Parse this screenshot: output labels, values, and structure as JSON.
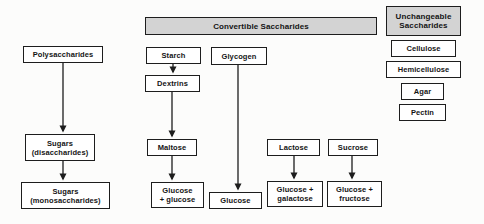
{
  "diagram": {
    "type": "flowchart",
    "topic": "Classification and breakdown of saccharides",
    "colors": {
      "border": "#1d1d1d",
      "header_fill": "#d3d3d3",
      "box_fill": "#ffffff",
      "line": "#1d1d1d",
      "background": "#fcfcfb"
    },
    "headers": {
      "convertible": "Convertible Saccharides",
      "unchangeable": "Unchangeable\nSaccharides"
    },
    "left_column": {
      "polysaccharides": "Polysaccharides",
      "sugars_disaccharides": "Sugars\n(disaccharides)",
      "sugars_monosaccharides": "Sugars\n(monosaccharides)"
    },
    "convertible_column": {
      "starch": "Starch",
      "dextrins": "Dextrins",
      "maltose": "Maltose",
      "glucose_glucose": "Glucose\n+ glucose",
      "glycogen": "Glycogen",
      "glucose": "Glucose",
      "lactose": "Lactose",
      "glucose_galactose": "Glucose +\ngalactose",
      "sucrose": "Sucrose",
      "glucose_fructose": "Glucose +\nfructose"
    },
    "unchangeable_column": {
      "cellulose": "Cellulose",
      "hemicellulose": "Hemicellulose",
      "agar": "Agar",
      "pectin": "Pectin"
    },
    "edges": [
      "Polysaccharides -> Sugars (disaccharides)",
      "Sugars (disaccharides) -> Sugars (monosaccharides)",
      "Starch -> Dextrins",
      "Dextrins -> Maltose",
      "Maltose -> Glucose + glucose",
      "Glycogen -> Glucose",
      "Lactose -> Glucose + galactose",
      "Sucrose -> Glucose + fructose"
    ]
  }
}
